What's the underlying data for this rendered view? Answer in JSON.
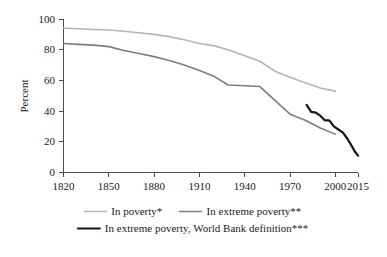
{
  "chart_data": {
    "type": "line",
    "title": "",
    "subtitle": "",
    "xlabel": "",
    "ylabel": "Percent",
    "xlim": [
      1820,
      2015
    ],
    "ylim": [
      0,
      100
    ],
    "grid": false,
    "legend_position": "bottom",
    "x_ticks": [
      1820,
      1850,
      1880,
      1910,
      1940,
      1970,
      2000,
      2015
    ],
    "x_tick_labels": [
      "1820",
      "1850",
      "1880",
      "1910",
      "1940",
      "1970",
      "2000",
      "2015"
    ],
    "y_ticks": [
      0,
      20,
      40,
      60,
      80,
      100
    ],
    "y_tick_labels": [
      "0",
      "20",
      "40",
      "60",
      "80",
      "100"
    ],
    "series": [
      {
        "name": "In poverty*",
        "color": "#b5b5b5",
        "width": 1.6,
        "x": [
          1820,
          1830,
          1840,
          1850,
          1860,
          1870,
          1880,
          1890,
          1900,
          1910,
          1920,
          1929,
          1940,
          1950,
          1960,
          1970,
          1980,
          1990,
          2000
        ],
        "y": [
          94.0,
          93.6,
          93.2,
          92.8,
          92.0,
          91.0,
          90.0,
          88.5,
          86.5,
          84.0,
          82.5,
          80.0,
          76.0,
          72.5,
          66.0,
          62.0,
          58.5,
          55.0,
          53.0
        ]
      },
      {
        "name": "In extreme poverty**",
        "color": "#7d7d7d",
        "width": 1.6,
        "x": [
          1820,
          1830,
          1840,
          1850,
          1860,
          1870,
          1880,
          1890,
          1900,
          1910,
          1920,
          1929,
          1940,
          1950,
          1960,
          1970,
          1980,
          1990,
          2000
        ],
        "y": [
          84.0,
          83.5,
          83.0,
          82.0,
          79.5,
          77.5,
          75.5,
          73.0,
          70.0,
          66.5,
          62.5,
          57.0,
          56.5,
          56.0,
          47.0,
          38.0,
          34.0,
          29.0,
          25.0
        ]
      },
      {
        "name": "In extreme poverty, World Bank definition***",
        "color": "#161616",
        "width": 2.2,
        "x": [
          1981,
          1984,
          1987,
          1990,
          1993,
          1996,
          1999,
          2002,
          2005,
          2008,
          2011,
          2013,
          2015
        ],
        "y": [
          44.0,
          39.5,
          39.0,
          37.0,
          34.0,
          34.0,
          30.0,
          28.0,
          26.0,
          22.0,
          17.0,
          13.5,
          11.0
        ]
      }
    ],
    "legend": [
      {
        "label": "In poverty*",
        "color": "#b5b5b5",
        "row": 1
      },
      {
        "label": "In extreme poverty**",
        "color": "#7d7d7d",
        "row": 1
      },
      {
        "label": "In extreme poverty, World Bank definition***",
        "color": "#161616",
        "row": 2
      }
    ]
  }
}
